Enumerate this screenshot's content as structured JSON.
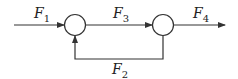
{
  "diagram": {
    "type": "block-diagram",
    "nodes": [
      {
        "id": "sum1",
        "shape": "circle"
      },
      {
        "id": "sum2",
        "shape": "circle"
      }
    ],
    "edges": [
      {
        "from": "input",
        "to": "sum1",
        "label": "F",
        "sub": "1"
      },
      {
        "from": "sum1",
        "to": "sum2",
        "label": "F",
        "sub": "3"
      },
      {
        "from": "sum2",
        "to": "output",
        "label": "F",
        "sub": "4"
      },
      {
        "from": "sum2",
        "to": "sum1",
        "label": "F",
        "sub": "2",
        "kind": "feedback"
      }
    ],
    "colors": {
      "stroke": "#333333",
      "background": "#ffffff"
    }
  }
}
